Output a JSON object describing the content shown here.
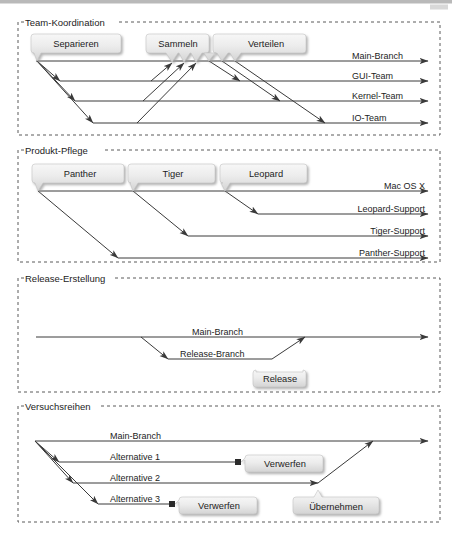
{
  "document": {
    "title": "Branching-Strategien",
    "background_color": "#ffffff",
    "line_color": "#3a3a3a",
    "panel_border_color": "#555555",
    "callout_fill_top": "#f4f4f4",
    "callout_fill_bottom": "#d9d9d9",
    "callout_shadow": "#b4b4b4"
  },
  "panels": [
    {
      "id": "team-koordination",
      "title": "Team-Koordination",
      "branches": [
        {
          "label": "Main-Branch"
        },
        {
          "label": "GUI-Team"
        },
        {
          "label": "Kernel-Team"
        },
        {
          "label": "IO-Team"
        }
      ],
      "callouts": [
        {
          "label": "Separieren"
        },
        {
          "label": "Sammeln"
        },
        {
          "label": "Verteilen"
        }
      ]
    },
    {
      "id": "produkt-pflege",
      "title": "Produkt-Pflege",
      "branches": [
        {
          "label": "Mac OS X"
        },
        {
          "label": "Leopard-Support"
        },
        {
          "label": "Tiger-Support"
        },
        {
          "label": "Panther-Support"
        }
      ],
      "callouts": [
        {
          "label": "Panther"
        },
        {
          "label": "Tiger"
        },
        {
          "label": "Leopard"
        }
      ]
    },
    {
      "id": "release-erstellung",
      "title": "Release-Erstellung",
      "branches": [
        {
          "label": "Main-Branch"
        },
        {
          "label": "Release-Branch"
        }
      ],
      "callouts": [
        {
          "label": "Release"
        }
      ]
    },
    {
      "id": "versuchsreihen",
      "title": "Versuchsreihen",
      "branches": [
        {
          "label": "Main-Branch"
        },
        {
          "label": "Alternative 1"
        },
        {
          "label": "Alternative 2"
        },
        {
          "label": "Alternative 3"
        }
      ],
      "callouts": [
        {
          "label": "Verwerfen"
        },
        {
          "label": "Verwerfen"
        },
        {
          "label": "Übernehmen"
        }
      ]
    }
  ]
}
